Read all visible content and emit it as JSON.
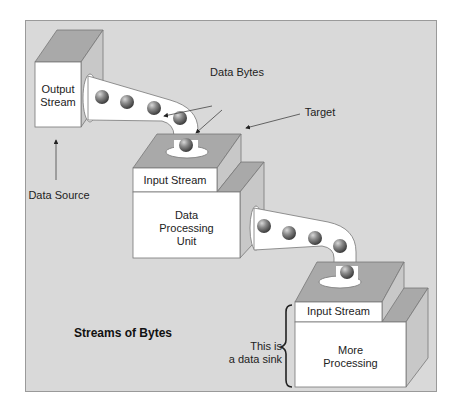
{
  "diagram": {
    "title": "Streams of Bytes",
    "nodes": {
      "source_box": {
        "label": "Output Stream"
      },
      "processing_unit": {
        "header": "Input Stream",
        "body": "Data Processing Unit"
      },
      "sink_box": {
        "header": "Input Stream",
        "body": "More Processing"
      }
    },
    "annotations": {
      "data_source": "Data Source",
      "data_bytes": "Data Bytes",
      "target": "Target",
      "data_sink": "This is a data sink"
    },
    "colors": {
      "panel_bg": "#d9d9d9",
      "box_top": "#a9a9a9",
      "box_side": "#c8c8c8",
      "box_front": "#ffffff",
      "ball": "#7a7a7a"
    }
  },
  "labels": {
    "output_stream_l1": "Output",
    "output_stream_l2": "Stream",
    "input_stream_1": "Input Stream",
    "dpu_l1": "Data",
    "dpu_l2": "Processing",
    "dpu_l3": "Unit",
    "input_stream_2": "Input Stream",
    "more_l1": "More",
    "more_l2": "Processing",
    "data_source": "Data Source",
    "data_bytes": "Data Bytes",
    "target": "Target",
    "sink_l1": "This is",
    "sink_l2": "a data sink",
    "title": "Streams of Bytes"
  }
}
